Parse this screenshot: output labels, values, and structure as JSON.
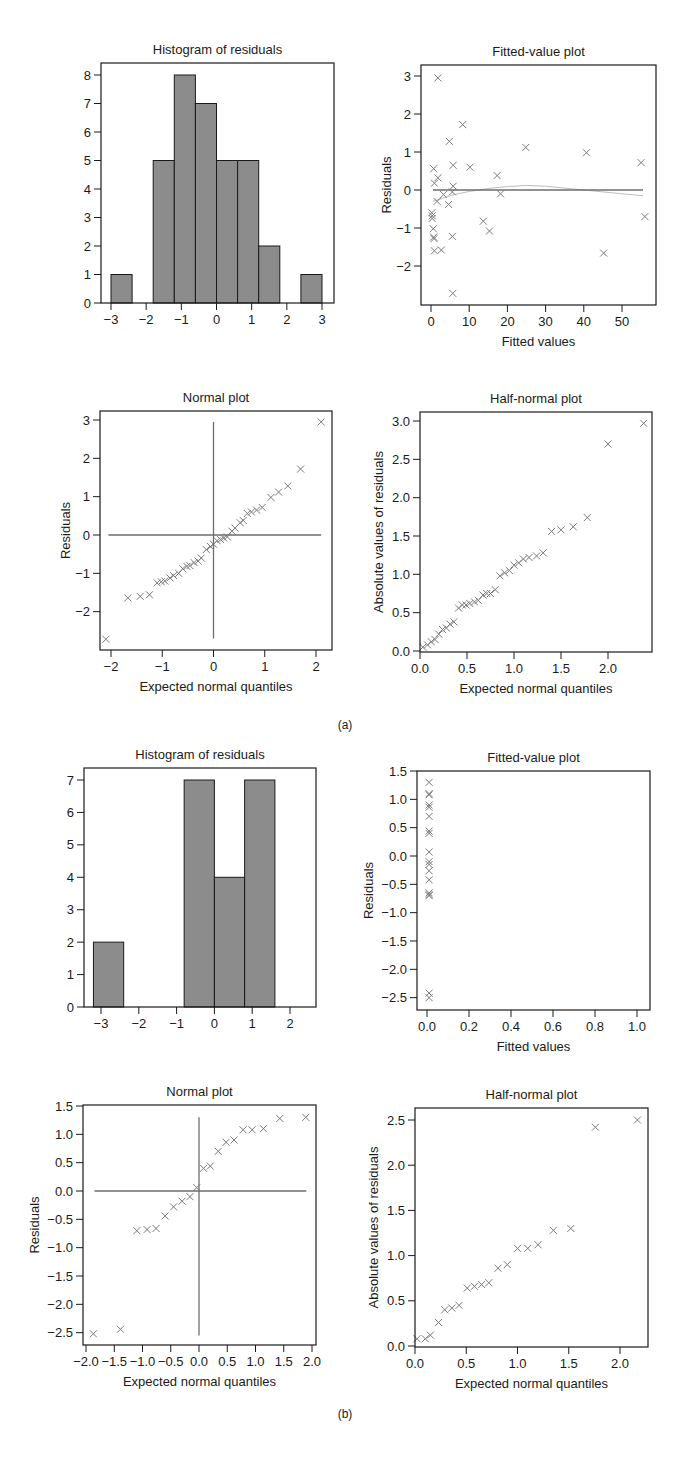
{
  "figure": {
    "captions": [
      "(a)",
      "(b)"
    ]
  },
  "chart_data": [
    {
      "id": "a_hist",
      "group": "(a)",
      "type": "bar",
      "title": "Histogram of residuals",
      "xlabel": "",
      "ylabel": "",
      "xticks": [
        -3,
        -2,
        -1,
        0,
        1,
        2,
        3
      ],
      "yticks": [
        0,
        1,
        2,
        3,
        4,
        5,
        6,
        7,
        8
      ],
      "xlim": [
        -3.3,
        3.4
      ],
      "ylim": [
        0,
        8.4
      ],
      "bin_edges": [
        -3.0,
        -2.4,
        -1.8,
        -1.2,
        -0.6,
        0.0,
        0.6,
        1.2,
        1.8,
        2.4,
        3.0
      ],
      "values": [
        1,
        0,
        5,
        8,
        7,
        5,
        5,
        2,
        0,
        1
      ],
      "frame": {
        "x0": 101,
        "x1": 334,
        "y0": 63,
        "y1": 303
      },
      "map": {
        "xa": -3,
        "px_a": 111,
        "xb": 3,
        "px_b": 322,
        "ya": 0,
        "py_a": 303,
        "yb": 8,
        "py_b": 75
      }
    },
    {
      "id": "a_fitted",
      "group": "(a)",
      "type": "scatter",
      "title": "Fitted-value plot",
      "xlabel": "Fitted values",
      "ylabel": "Residuals",
      "xticks": [
        0,
        10,
        20,
        30,
        40,
        50
      ],
      "yticks": [
        -2,
        -1,
        0,
        1,
        2,
        3
      ],
      "xlim": [
        -2,
        59
      ],
      "ylim": [
        -3,
        3.1
      ],
      "points": [
        [
          1.8,
          2.95
        ],
        [
          8.3,
          1.72
        ],
        [
          4.8,
          1.28
        ],
        [
          24.8,
          1.12
        ],
        [
          40.7,
          0.98
        ],
        [
          55,
          0.72
        ],
        [
          5.8,
          0.65
        ],
        [
          10.2,
          0.6
        ],
        [
          0.7,
          0.56
        ],
        [
          17.3,
          0.38
        ],
        [
          1.8,
          0.32
        ],
        [
          0.9,
          0.18
        ],
        [
          5.8,
          0.1
        ],
        [
          3.3,
          -0.12
        ],
        [
          18.2,
          -0.1
        ],
        [
          5.6,
          -0.05
        ],
        [
          1.6,
          -0.3
        ],
        [
          4.6,
          -0.38
        ],
        [
          0.2,
          -0.6
        ],
        [
          0.3,
          -0.68
        ],
        [
          0.3,
          -0.75
        ],
        [
          56,
          -0.7
        ],
        [
          13.7,
          -0.82
        ],
        [
          0.6,
          -1.02
        ],
        [
          15.3,
          -1.08
        ],
        [
          5.6,
          -1.22
        ],
        [
          0.7,
          -1.24
        ],
        [
          0.8,
          -1.28
        ],
        [
          0.9,
          -1.6
        ],
        [
          2.7,
          -1.58
        ],
        [
          45.2,
          -1.66
        ],
        [
          5.7,
          -2.72
        ]
      ],
      "reference_line": {
        "y": 0,
        "x_from": 0.5,
        "x_to": 55.5
      },
      "smooth_curve": [
        [
          0.5,
          -0.3
        ],
        [
          3,
          -0.22
        ],
        [
          6,
          -0.12
        ],
        [
          10,
          -0.04
        ],
        [
          15,
          0.04
        ],
        [
          20,
          0.09
        ],
        [
          25,
          0.12
        ],
        [
          30,
          0.1
        ],
        [
          35,
          0.05
        ],
        [
          40,
          0.0
        ],
        [
          45,
          -0.05
        ],
        [
          50,
          -0.1
        ],
        [
          55.5,
          -0.15
        ]
      ],
      "frame": {
        "x0": 421,
        "x1": 656,
        "y0": 65,
        "y1": 305
      },
      "map": {
        "xa": 0,
        "px_a": 431,
        "xb": 50,
        "px_b": 622,
        "ya": 0,
        "py_a": 190,
        "yb": 3,
        "py_b": 76
      }
    },
    {
      "id": "a_normal",
      "group": "(a)",
      "type": "scatter",
      "title": "Normal plot",
      "xlabel": "Expected normal quantiles",
      "ylabel": "Residuals",
      "xticks": [
        -2,
        -1,
        0,
        1,
        2
      ],
      "yticks": [
        -2,
        -1,
        0,
        1,
        2,
        3
      ],
      "xlim": [
        -2.2,
        2.3
      ],
      "ylim": [
        -3,
        3.2
      ],
      "points": [
        [
          -2.1,
          -2.72
        ],
        [
          -1.67,
          -1.64
        ],
        [
          -1.43,
          -1.6
        ],
        [
          -1.25,
          -1.56
        ],
        [
          -1.1,
          -1.25
        ],
        [
          -1.02,
          -1.22
        ],
        [
          -0.95,
          -1.2
        ],
        [
          -0.85,
          -1.12
        ],
        [
          -0.78,
          -1.06
        ],
        [
          -0.68,
          -1.0
        ],
        [
          -0.6,
          -0.88
        ],
        [
          -0.52,
          -0.82
        ],
        [
          -0.46,
          -0.8
        ],
        [
          -0.38,
          -0.72
        ],
        [
          -0.3,
          -0.68
        ],
        [
          -0.24,
          -0.6
        ],
        [
          -0.14,
          -0.38
        ],
        [
          -0.06,
          -0.3
        ],
        [
          0.0,
          -0.24
        ],
        [
          0.07,
          -0.15
        ],
        [
          0.14,
          -0.12
        ],
        [
          0.2,
          -0.08
        ],
        [
          0.27,
          -0.05
        ],
        [
          0.36,
          0.1
        ],
        [
          0.42,
          0.18
        ],
        [
          0.52,
          0.32
        ],
        [
          0.58,
          0.38
        ],
        [
          0.66,
          0.56
        ],
        [
          0.74,
          0.6
        ],
        [
          0.84,
          0.65
        ],
        [
          0.95,
          0.72
        ],
        [
          1.12,
          0.98
        ],
        [
          1.27,
          1.12
        ],
        [
          1.45,
          1.28
        ],
        [
          1.7,
          1.72
        ],
        [
          2.1,
          2.95
        ]
      ],
      "reference_lines": [
        {
          "orientation": "h",
          "value": 0,
          "from": -2.05,
          "to": 2.1
        },
        {
          "orientation": "v",
          "value": 0,
          "from": -2.7,
          "to": 2.95
        }
      ],
      "frame": {
        "x0": 100,
        "x1": 332,
        "y0": 411,
        "y1": 650
      },
      "map": {
        "xa": -2,
        "px_a": 111,
        "xb": 2,
        "px_b": 316,
        "ya": 0,
        "py_a": 535,
        "yb": 3,
        "py_b": 420
      }
    },
    {
      "id": "a_halfnormal",
      "group": "(a)",
      "type": "scatter",
      "title": "Half-normal plot",
      "xlabel": "Expected normal quantiles",
      "ylabel": "Absolute values of residuals",
      "xticks": [
        "0.0",
        "0.5",
        "1.0",
        "1.5",
        "2.0"
      ],
      "yticks": [
        "0.0",
        "0.5",
        "1.0",
        "1.5",
        "2.0",
        "2.5",
        "3.0"
      ],
      "xlim": [
        0,
        2.5
      ],
      "ylim": [
        0,
        3.1
      ],
      "points": [
        [
          0.03,
          0.05
        ],
        [
          0.08,
          0.08
        ],
        [
          0.12,
          0.12
        ],
        [
          0.16,
          0.15
        ],
        [
          0.2,
          0.22
        ],
        [
          0.24,
          0.28
        ],
        [
          0.28,
          0.3
        ],
        [
          0.32,
          0.35
        ],
        [
          0.36,
          0.38
        ],
        [
          0.41,
          0.56
        ],
        [
          0.45,
          0.6
        ],
        [
          0.49,
          0.6
        ],
        [
          0.53,
          0.62
        ],
        [
          0.58,
          0.64
        ],
        [
          0.62,
          0.66
        ],
        [
          0.67,
          0.73
        ],
        [
          0.71,
          0.75
        ],
        [
          0.75,
          0.75
        ],
        [
          0.8,
          0.8
        ],
        [
          0.85,
          0.98
        ],
        [
          0.9,
          1.02
        ],
        [
          0.95,
          1.05
        ],
        [
          1.0,
          1.12
        ],
        [
          1.05,
          1.15
        ],
        [
          1.1,
          1.2
        ],
        [
          1.16,
          1.22
        ],
        [
          1.24,
          1.24
        ],
        [
          1.31,
          1.28
        ],
        [
          1.4,
          1.56
        ],
        [
          1.5,
          1.58
        ],
        [
          1.63,
          1.62
        ],
        [
          1.78,
          1.74
        ],
        [
          2.0,
          2.7
        ],
        [
          2.38,
          2.97
        ]
      ],
      "frame": {
        "x0": 420,
        "x1": 652,
        "y0": 412,
        "y1": 652
      },
      "map": {
        "xa": 0,
        "px_a": 420,
        "xb": 2,
        "px_b": 608,
        "ya": 0,
        "py_a": 651,
        "yb": 3,
        "py_b": 421
      }
    },
    {
      "id": "b_hist",
      "group": "(b)",
      "type": "bar",
      "title": "Histogram of residuals",
      "xlabel": "",
      "ylabel": "",
      "xticks": [
        -3,
        -2,
        -1,
        0,
        1,
        2
      ],
      "yticks": [
        0,
        1,
        2,
        3,
        4,
        5,
        6,
        7
      ],
      "xlim": [
        -3.4,
        2.7
      ],
      "ylim": [
        0,
        7.4
      ],
      "bin_edges": [
        -3.2,
        -2.4,
        -1.6,
        -0.8,
        0.0,
        0.8,
        1.6
      ],
      "values": [
        2,
        0,
        0,
        7,
        4,
        7
      ],
      "frame": {
        "x0": 84,
        "x1": 316,
        "y0": 768,
        "y1": 1007
      },
      "map": {
        "xa": -3,
        "px_a": 101,
        "xb": 2,
        "px_b": 290,
        "ya": 0,
        "py_a": 1007,
        "yb": 7,
        "py_b": 780
      }
    },
    {
      "id": "b_fitted",
      "group": "(b)",
      "type": "scatter",
      "title": "Fitted-value plot",
      "xlabel": "Fitted values",
      "ylabel": "Residuals",
      "xticks": [
        "0.0",
        "0.2",
        "0.4",
        "0.6",
        "0.8",
        "1.0"
      ],
      "yticks": [
        "-2.5",
        "-2.0",
        "-1.5",
        "-1.0",
        "-0.5",
        "0.0",
        "0.5",
        "1.0",
        "1.5"
      ],
      "xlim": [
        -0.05,
        1.05
      ],
      "ylim": [
        -2.7,
        1.5
      ],
      "points": [
        [
          0.01,
          1.3
        ],
        [
          0.01,
          1.1
        ],
        [
          0.01,
          1.08
        ],
        [
          0.01,
          0.9
        ],
        [
          0.01,
          0.86
        ],
        [
          0.01,
          0.7
        ],
        [
          0.01,
          0.44
        ],
        [
          0.01,
          0.4
        ],
        [
          0.01,
          0.07
        ],
        [
          0.01,
          -0.1
        ],
        [
          0.01,
          -0.15
        ],
        [
          0.01,
          -0.26
        ],
        [
          0.01,
          -0.42
        ],
        [
          0.01,
          -0.65
        ],
        [
          0.01,
          -0.68
        ],
        [
          0.01,
          -0.7
        ],
        [
          0.01,
          -2.42
        ],
        [
          0.01,
          -2.5
        ]
      ],
      "frame": {
        "x0": 417,
        "x1": 650,
        "y0": 771,
        "y1": 1010
      },
      "map": {
        "xa": 0,
        "px_a": 427,
        "xb": 1,
        "px_b": 637,
        "ya": 0,
        "py_a": 856,
        "yb": 1.5,
        "py_b": 771
      }
    },
    {
      "id": "b_normal",
      "group": "(b)",
      "type": "scatter",
      "title": "Normal plot",
      "xlabel": "Expected normal quantiles",
      "ylabel": "Residuals",
      "xticks": [
        "-2.0",
        "-1.5",
        "-1.0",
        "-0.5",
        "0.0",
        "0.5",
        "1.0",
        "1.5",
        "2.0"
      ],
      "yticks": [
        "-2.5",
        "-2.0",
        "-1.5",
        "-1.0",
        "-0.5",
        "0.0",
        "0.5",
        "1.0",
        "1.5"
      ],
      "xlim": [
        -2.05,
        2.05
      ],
      "ylim": [
        -2.7,
        1.55
      ],
      "points": [
        [
          -1.87,
          -2.52
        ],
        [
          -1.39,
          -2.44
        ],
        [
          -1.1,
          -0.7
        ],
        [
          -0.92,
          -0.68
        ],
        [
          -0.76,
          -0.66
        ],
        [
          -0.6,
          -0.44
        ],
        [
          -0.45,
          -0.28
        ],
        [
          -0.3,
          -0.18
        ],
        [
          -0.16,
          -0.1
        ],
        [
          -0.04,
          0.06
        ],
        [
          0.08,
          0.4
        ],
        [
          0.2,
          0.44
        ],
        [
          0.34,
          0.7
        ],
        [
          0.48,
          0.86
        ],
        [
          0.62,
          0.9
        ],
        [
          0.78,
          1.08
        ],
        [
          0.94,
          1.08
        ],
        [
          1.14,
          1.1
        ],
        [
          1.43,
          1.28
        ],
        [
          1.89,
          1.3
        ]
      ],
      "reference_lines": [
        {
          "orientation": "h",
          "value": 0,
          "from": -1.85,
          "to": 1.9
        },
        {
          "orientation": "v",
          "value": 0,
          "from": -2.55,
          "to": 1.3
        }
      ],
      "frame": {
        "x0": 83,
        "x1": 316,
        "y0": 1105,
        "y1": 1345
      },
      "map": {
        "xa": -2,
        "px_a": 86,
        "xb": 2,
        "px_b": 312,
        "ya": 0,
        "py_a": 1191,
        "yb": 1.5,
        "py_b": 1106
      }
    },
    {
      "id": "b_halfnormal",
      "group": "(b)",
      "type": "scatter",
      "title": "Half-normal plot",
      "xlabel": "Expected normal quantiles",
      "ylabel": "Absolute values of residuals",
      "xticks": [
        "0.0",
        "0.5",
        "1.0",
        "1.5",
        "2.0"
      ],
      "yticks": [
        "0.0",
        "0.5",
        "1.0",
        "1.5",
        "2.0",
        "2.5"
      ],
      "xlim": [
        0,
        2.3
      ],
      "ylim": [
        0,
        2.62
      ],
      "points": [
        [
          0.02,
          0.08
        ],
        [
          0.1,
          0.08
        ],
        [
          0.15,
          0.12
        ],
        [
          0.23,
          0.26
        ],
        [
          0.29,
          0.4
        ],
        [
          0.36,
          0.42
        ],
        [
          0.43,
          0.45
        ],
        [
          0.51,
          0.64
        ],
        [
          0.58,
          0.66
        ],
        [
          0.65,
          0.68
        ],
        [
          0.72,
          0.7
        ],
        [
          0.81,
          0.86
        ],
        [
          0.9,
          0.9
        ],
        [
          1.0,
          1.08
        ],
        [
          1.1,
          1.08
        ],
        [
          1.2,
          1.12
        ],
        [
          1.35,
          1.28
        ],
        [
          1.52,
          1.3
        ],
        [
          1.76,
          2.42
        ],
        [
          2.17,
          2.5
        ]
      ],
      "frame": {
        "x0": 415,
        "x1": 648,
        "y0": 1108,
        "y1": 1347
      },
      "map": {
        "xa": 0,
        "px_a": 415,
        "xb": 2,
        "px_b": 620,
        "ya": 0,
        "py_a": 1346,
        "yb": 2.5,
        "py_b": 1120
      }
    }
  ]
}
